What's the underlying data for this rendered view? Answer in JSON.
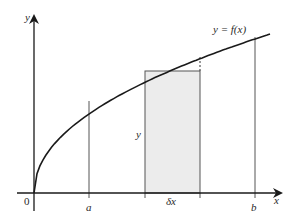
{
  "diagram": {
    "curve_label": "y = f(x)",
    "axis_labels": {
      "x": "x",
      "y": "y"
    },
    "origin_label": "0",
    "markers": {
      "a": "a",
      "b": "b"
    },
    "strip": {
      "width_label": "δx",
      "height_label": "y"
    },
    "colors": {
      "strip_fill": "#ececec",
      "lines": "#1a1a1a",
      "guides": "#555555"
    }
  }
}
